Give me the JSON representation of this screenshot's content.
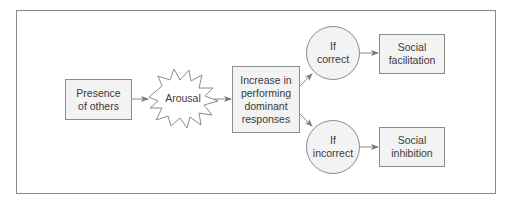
{
  "diagram": {
    "nodes": {
      "presence": {
        "label": "Presence\nof others",
        "shape": "rectangle"
      },
      "arousal": {
        "label": "Arousal",
        "shape": "starburst"
      },
      "increase": {
        "label": "Increase in\nperforming\ndominant\nresponses",
        "shape": "rectangle"
      },
      "if_correct": {
        "label": "If\ncorrect",
        "shape": "circle"
      },
      "if_incorrect": {
        "label": "If\nincorrect",
        "shape": "circle"
      },
      "facilitation": {
        "label": "Social\nfacilitation",
        "shape": "rectangle"
      },
      "inhibition": {
        "label": "Social\ninhibition",
        "shape": "rectangle"
      }
    },
    "edges": [
      {
        "from": "presence",
        "to": "arousal"
      },
      {
        "from": "arousal",
        "to": "increase"
      },
      {
        "from": "increase",
        "to": "if_correct"
      },
      {
        "from": "increase",
        "to": "if_incorrect"
      },
      {
        "from": "if_correct",
        "to": "facilitation"
      },
      {
        "from": "if_incorrect",
        "to": "inhibition"
      }
    ],
    "colors": {
      "stroke": "#8c8c8c",
      "fill": "#f3f3f3",
      "text": "#3a3a3a"
    }
  }
}
